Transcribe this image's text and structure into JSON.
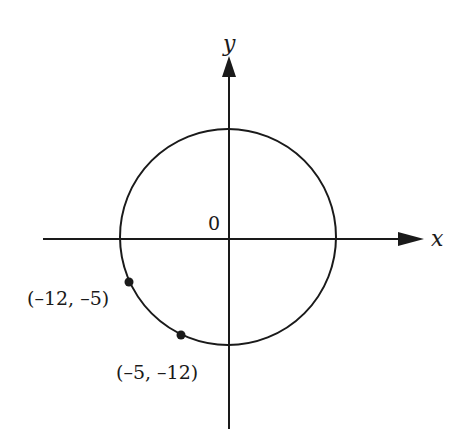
{
  "diagram": {
    "type": "coordinate-plane-circle",
    "axes": {
      "x_label": "x",
      "y_label": "y",
      "origin_label": "0"
    },
    "circle": {
      "center": [
        0,
        0
      ],
      "radius": 13
    },
    "points": [
      {
        "label": "(–12, –5)",
        "x": -12,
        "y": -5
      },
      {
        "label": "(–5, –12)",
        "x": -5,
        "y": -12
      }
    ],
    "colors": {
      "stroke": "#1a1a1a",
      "background": "#ffffff"
    }
  }
}
